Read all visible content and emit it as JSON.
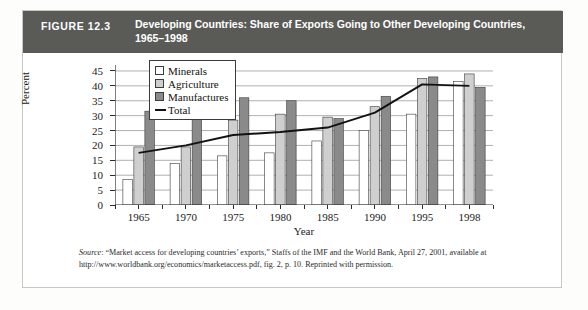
{
  "figure": {
    "number_label": "FIGURE 12.3",
    "title": "Developing Countries: Share of Exports Going to Other Developing Countries, 1965–1998"
  },
  "source": {
    "label": "Source",
    "text": ": “Market access for developing countries’ exports,” Staffs of the IMF and the World Bank, April 27, 2001, available at http://www.worldbank.org/economics/marketaccess.pdf, fig. 2, p. 10. Reprinted with permission."
  },
  "colors": {
    "header_bar": "#5a5a57",
    "minerals": "#ffffff",
    "agriculture": "#cfcfcf",
    "manufactures": "#8a8a8a",
    "total_line": "#111111",
    "axis": "#2b2b2b",
    "gridline": "#8f8f8f"
  },
  "chart_data": {
    "type": "bar",
    "title": "Developing Countries: Share of Exports Going to Other Developing Countries, 1965–1998",
    "xlabel": "Year",
    "ylabel": "Percent",
    "categories": [
      "1965",
      "1970",
      "1975",
      "1980",
      "1985",
      "1990",
      "1995",
      "1998"
    ],
    "ylim": [
      0,
      47
    ],
    "yticks": [
      0,
      5,
      10,
      15,
      20,
      25,
      30,
      35,
      40,
      45
    ],
    "grid": true,
    "legend_position": "upper-left-inside",
    "series": [
      {
        "name": "Minerals",
        "type": "bar",
        "values": [
          8.5,
          14.0,
          16.5,
          17.5,
          21.5,
          25.0,
          30.5,
          41.5
        ]
      },
      {
        "name": "Agriculture",
        "type": "bar",
        "values": [
          19.5,
          19.5,
          28.5,
          30.5,
          29.5,
          33.0,
          42.5,
          44.0
        ]
      },
      {
        "name": "Manufactures",
        "type": "bar",
        "values": [
          31.5,
          31.5,
          36.0,
          35.0,
          29.0,
          36.5,
          43.0,
          39.5
        ]
      },
      {
        "name": "Total",
        "type": "line",
        "values": [
          17.5,
          20.0,
          23.5,
          24.5,
          26.0,
          31.0,
          40.5,
          40.0
        ]
      }
    ]
  }
}
